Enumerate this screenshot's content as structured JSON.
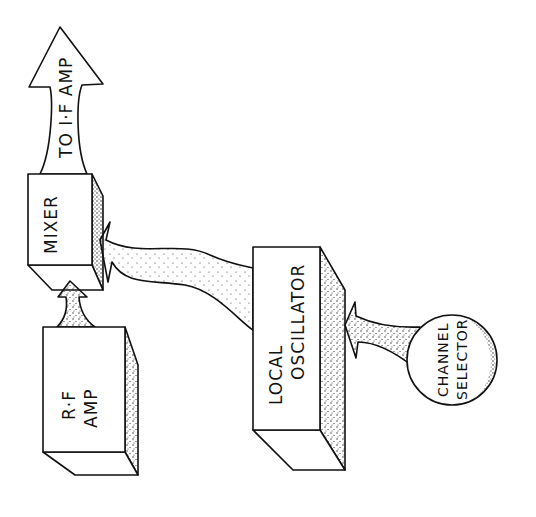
{
  "diagram": {
    "type": "block-diagram",
    "style": "hand-drawn, rotated 90 degrees counter-clockwise",
    "blocks": [
      {
        "id": "rf_amp",
        "label_lines": [
          "R·F",
          "AMP"
        ]
      },
      {
        "id": "mixer",
        "label_lines": [
          "MIXER"
        ]
      },
      {
        "id": "local_oscillator",
        "label_lines": [
          "LOCAL",
          "OSCILLATOR"
        ]
      },
      {
        "id": "channel_selector",
        "label_lines": [
          "CHANNEL",
          "SELECTOR"
        ],
        "shape": "circle"
      }
    ],
    "output_arrow": {
      "label": "TO I·F AMP"
    },
    "connections": [
      {
        "from": "rf_amp",
        "to": "mixer"
      },
      {
        "from": "local_oscillator",
        "to": "mixer"
      },
      {
        "from": "channel_selector",
        "to": "local_oscillator"
      },
      {
        "from": "mixer",
        "to": "output_arrow"
      }
    ],
    "colors": {
      "ink": "#111111",
      "background": "#ffffff"
    }
  }
}
